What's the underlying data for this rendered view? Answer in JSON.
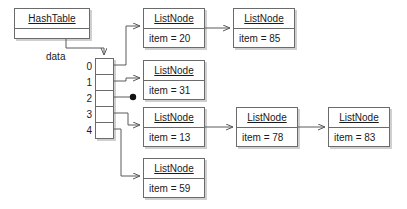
{
  "diagram": {
    "type": "hash-table-separate-chaining",
    "title_object": {
      "name": "HashTable",
      "field_label": "data"
    },
    "array": {
      "slot_labels": [
        "0",
        "1",
        "2",
        "3",
        "4"
      ],
      "slot_count": 5,
      "null_slots": [
        "2"
      ]
    },
    "chains": [
      {
        "bucket": "0",
        "nodes": [
          {
            "class_name": "ListNode",
            "field": "item = 20"
          },
          {
            "class_name": "ListNode",
            "field": "item = 85"
          }
        ]
      },
      {
        "bucket": "1",
        "nodes": [
          {
            "class_name": "ListNode",
            "field": "item = 31"
          }
        ]
      },
      {
        "bucket": "2",
        "nodes": []
      },
      {
        "bucket": "3",
        "nodes": [
          {
            "class_name": "ListNode",
            "field": "item = 13"
          },
          {
            "class_name": "ListNode",
            "field": "item = 78"
          },
          {
            "class_name": "ListNode",
            "field": "item = 83"
          }
        ]
      },
      {
        "bucket": "4",
        "nodes": [
          {
            "class_name": "ListNode",
            "field": "item = 59"
          }
        ]
      }
    ],
    "colors": {
      "background": "#ffffff",
      "border": "#6b6b6b",
      "shadow": "#cfcfcf",
      "connector": "#5a5a5a",
      "text": "#1a1a1a",
      "null_dot": "#111111"
    }
  }
}
